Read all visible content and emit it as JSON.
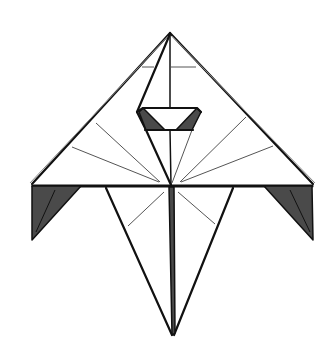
{
  "diagram": {
    "colors": {
      "background": "#ffffff",
      "line": "#111111",
      "crease": "#555555",
      "shade": "#4a4a4a"
    },
    "points": {
      "apex": [
        170,
        33
      ],
      "left_wing_tip": [
        31,
        184
      ],
      "right_wing_tip": [
        315,
        184
      ],
      "center": [
        171,
        185
      ],
      "bottom_point": [
        173,
        335
      ]
    }
  }
}
